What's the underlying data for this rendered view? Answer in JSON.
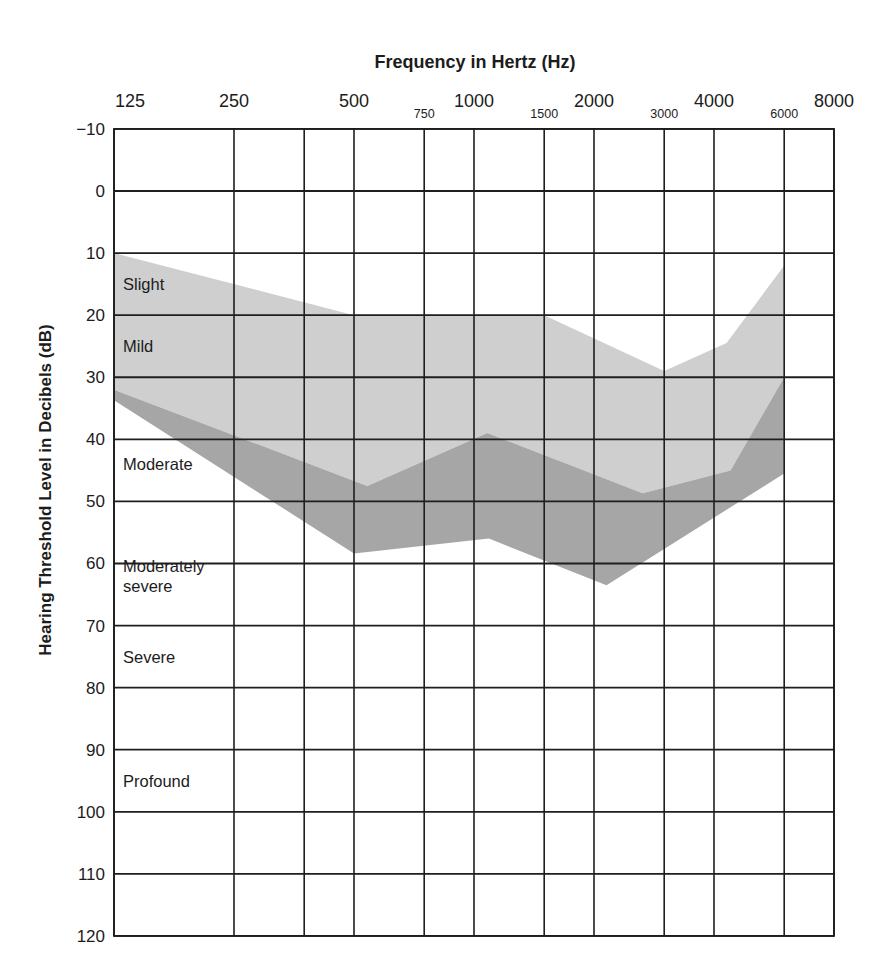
{
  "chart_data": {
    "type": "area",
    "title": "",
    "xlabel": "Frequency in Hertz (Hz)",
    "ylabel": "Hearing Threshold Level in Decibels (dB)",
    "x_scale": "log2",
    "xlim": [
      125,
      8000
    ],
    "ylim": [
      -10,
      120
    ],
    "y_inverted": true,
    "grid": true,
    "legend": "none",
    "x_gridlines": [
      125,
      250,
      375,
      500,
      750,
      1000,
      1500,
      2000,
      3000,
      4000,
      6000,
      8000
    ],
    "x_major_ticks": [
      {
        "value": 125,
        "label": "125"
      },
      {
        "value": 250,
        "label": "250"
      },
      {
        "value": 500,
        "label": "500"
      },
      {
        "value": 1000,
        "label": "1000"
      },
      {
        "value": 2000,
        "label": "2000"
      },
      {
        "value": 4000,
        "label": "4000"
      },
      {
        "value": 8000,
        "label": "8000"
      }
    ],
    "x_minor_ticks": [
      {
        "value": 750,
        "label": "750"
      },
      {
        "value": 1500,
        "label": "1500"
      },
      {
        "value": 3000,
        "label": "3000"
      },
      {
        "value": 6000,
        "label": "6000"
      }
    ],
    "y_ticks": [
      {
        "value": -10,
        "label": "−10"
      },
      {
        "value": 0,
        "label": "0"
      },
      {
        "value": 10,
        "label": "10"
      },
      {
        "value": 20,
        "label": "20"
      },
      {
        "value": 30,
        "label": "30"
      },
      {
        "value": 40,
        "label": "40"
      },
      {
        "value": 50,
        "label": "50"
      },
      {
        "value": 60,
        "label": "60"
      },
      {
        "value": 70,
        "label": "70"
      },
      {
        "value": 80,
        "label": "80"
      },
      {
        "value": 90,
        "label": "90"
      },
      {
        "value": 100,
        "label": "100"
      },
      {
        "value": 110,
        "label": "110"
      },
      {
        "value": 120,
        "label": "120"
      }
    ],
    "region_labels": [
      {
        "lines": [
          "Slight"
        ],
        "db": 15
      },
      {
        "lines": [
          "Mild"
        ],
        "db": 25
      },
      {
        "lines": [
          "Moderate"
        ],
        "db": 44
      },
      {
        "lines": [
          "Moderately",
          "severe"
        ],
        "db": 62
      },
      {
        "lines": [
          "Severe"
        ],
        "db": 75
      },
      {
        "lines": [
          "Profound"
        ],
        "db": 95
      }
    ],
    "series": [
      {
        "name": "light-band",
        "color": "#cfcfcf",
        "upper": [
          [
            125,
            10
          ],
          [
            500,
            20
          ],
          [
            1500,
            20
          ],
          [
            3000,
            29
          ],
          [
            4300,
            24.5
          ],
          [
            6000,
            12
          ]
        ],
        "lower": [
          [
            125,
            32
          ],
          [
            540,
            47.5
          ],
          [
            1080,
            39
          ],
          [
            2650,
            48.7
          ],
          [
            4400,
            45
          ],
          [
            6000,
            30
          ]
        ]
      },
      {
        "name": "dark-band",
        "color": "#a6a6a6",
        "upper": [
          [
            125,
            32
          ],
          [
            540,
            47.5
          ],
          [
            1080,
            39
          ],
          [
            2650,
            48.7
          ],
          [
            4400,
            45
          ],
          [
            6000,
            30
          ]
        ],
        "lower": [
          [
            125,
            33.7
          ],
          [
            500,
            58.4
          ],
          [
            1090,
            56
          ],
          [
            2150,
            63.5
          ],
          [
            6000,
            45.5
          ]
        ]
      }
    ]
  }
}
